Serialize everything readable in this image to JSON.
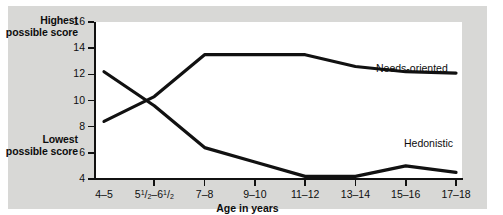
{
  "axis_labels": {
    "y_high": "Highest possible score",
    "y_low": "Lowest possible score",
    "x_title": "Age in years"
  },
  "series_labels": {
    "needs": "Needs-oriented",
    "hedonistic": "Hedonistic"
  },
  "colors": {
    "background": "#d8d8d6",
    "plot": "#ffffff",
    "line": "#111111",
    "text": "#0d0d0d"
  },
  "chart_data": {
    "type": "line",
    "title": "",
    "xlabel": "Age in years",
    "ylabel": "",
    "categories": [
      "4–5",
      "5½–6½",
      "7–8",
      "9–10",
      "11–12",
      "13–14",
      "15–16",
      "17–18"
    ],
    "categories_html": [
      "4&ndash;5",
      "5<sup>1</sup>/<sub>2</sub>&ndash;6<sup>1</sup>/<sub>2</sub>",
      "7&ndash;8",
      "9&ndash;10",
      "11&ndash;12",
      "13&ndash;14",
      "15&ndash;16",
      "17&ndash;18"
    ],
    "yticks": [
      16,
      14,
      12,
      10,
      8,
      6,
      4
    ],
    "ylim": [
      4,
      16
    ],
    "grid": false,
    "legend": "inline-annotations",
    "series": [
      {
        "name": "Needs-oriented",
        "values": [
          8.4,
          10.3,
          13.5,
          13.5,
          13.5,
          12.6,
          12.2,
          12.1
        ]
      },
      {
        "name": "Hedonistic",
        "values": [
          12.2,
          9.6,
          6.4,
          5.3,
          4.2,
          4.2,
          5.0,
          4.5
        ]
      }
    ]
  }
}
